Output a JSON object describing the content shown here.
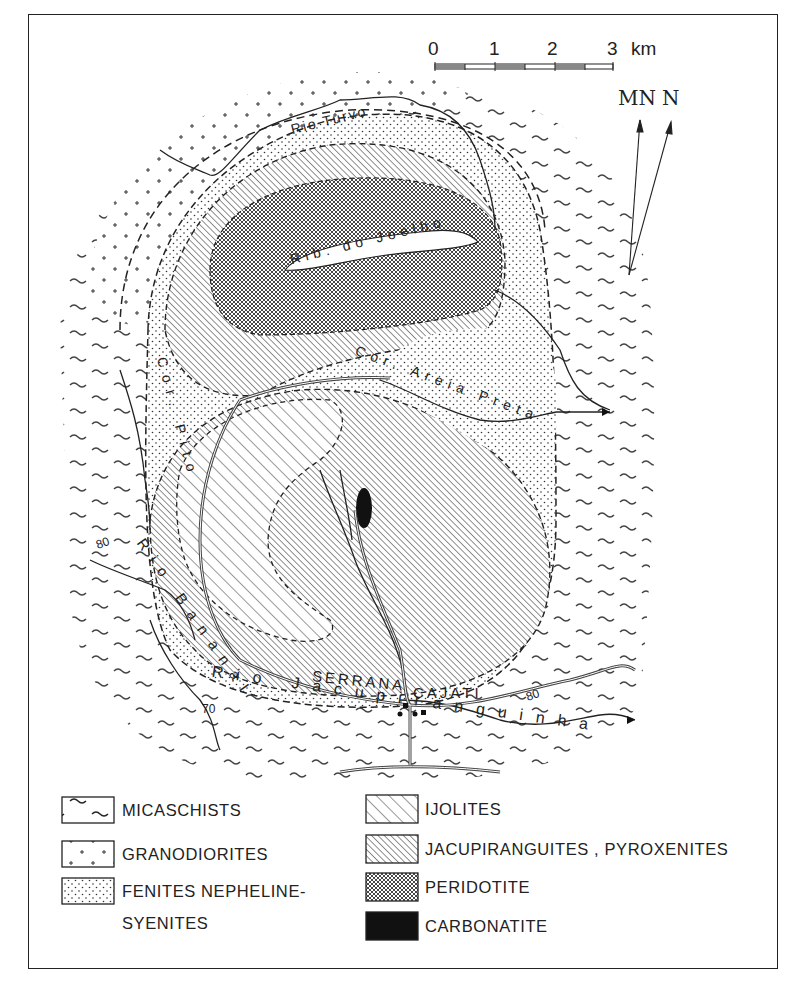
{
  "scale_bar": {
    "ticks": [
      "0",
      "1",
      "2",
      "3"
    ],
    "unit": "km"
  },
  "north_arrow": {
    "magnetic_north": "MN",
    "true_north": "N"
  },
  "rivers": {
    "rio_turvo": "Rio Turvo",
    "rib_do_joelho": "Rib. do Joelho",
    "cor_pito": "Cor. Pito",
    "cor_areia_preta": "Cor. Areia Preta",
    "rio_bananal": "Rio Bananal",
    "rio_jacupiranguinha": "Rio Jacupiranguinha"
  },
  "places": {
    "serrana": "SERRANA",
    "cajati": "CAJATI"
  },
  "annotations": {
    "dip_80_west": "80",
    "dip_80_east": "80",
    "dip_70": "70"
  },
  "legend": {
    "left": [
      {
        "label": "MICASCHISTS",
        "pattern": "wavy-dashes"
      },
      {
        "label": "GRANODIORITES",
        "pattern": "crosses"
      },
      {
        "label": "FENITES NEPHELINE-\nSYENITES",
        "line1": "FENITES NEPHELINE-",
        "line2": "SYENITES",
        "pattern": "fine-dots"
      }
    ],
    "right": [
      {
        "label": "IJOLITES",
        "pattern": "wide-diagonal-hatch"
      },
      {
        "label": "JACUPIRANGUITES , PYROXENITES",
        "pattern": "dense-diagonal-hatch"
      },
      {
        "label": "PERIDOTITE",
        "pattern": "crosshatch"
      },
      {
        "label": "CARBONATITE",
        "pattern": "solid-black"
      }
    ]
  },
  "colors": {
    "ink": "#222222",
    "paper": "#ffffff"
  }
}
